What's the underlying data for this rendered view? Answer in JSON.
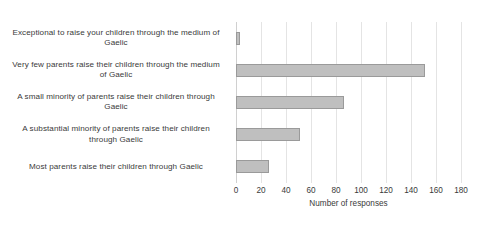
{
  "chart_data": {
    "type": "bar",
    "orientation": "horizontal",
    "title": "",
    "xlabel": "Number of responses",
    "ylabel": "",
    "xlim": [
      0,
      180
    ],
    "xticks": [
      0,
      20,
      40,
      60,
      80,
      100,
      120,
      140,
      160,
      180
    ],
    "grid": true,
    "legend": false,
    "categories": [
      "Exceptional to raise your children through the medium of Gaelic",
      "Very few parents raise their children through the medium of Gaelic",
      "A small minority of parents raise their children through Gaelic",
      "A substantial minority of parents raise their children through Gaelic",
      "Most parents raise their children through Gaelic"
    ],
    "values": [
      3,
      151,
      86,
      51,
      26
    ],
    "bar_color": "#bfbfbf",
    "bar_border_color": "#9a9a9a",
    "gridline_color": "#e4e4e4",
    "text_color": "#3a3a3a",
    "background_color": "#ffffff"
  }
}
